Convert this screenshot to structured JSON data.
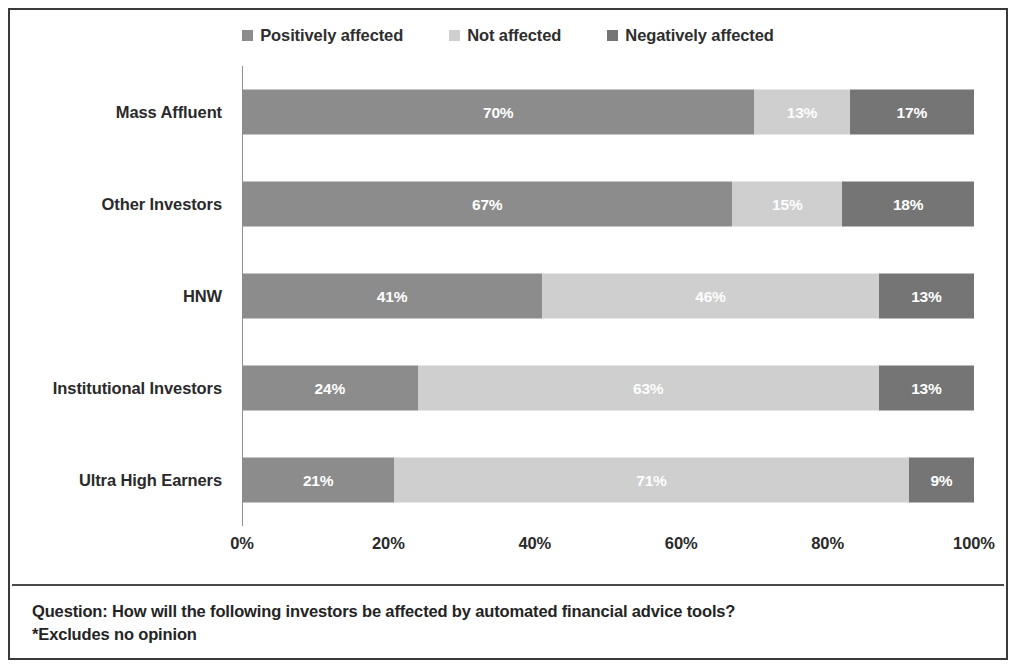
{
  "chart_data": {
    "type": "bar",
    "orientation": "horizontal",
    "stacked": true,
    "stack_mode": "percent",
    "title": "",
    "subtitle": "",
    "xlabel": "",
    "ylabel": "",
    "xlim": [
      0,
      100
    ],
    "grid": false,
    "legend_position": "top-center",
    "categories": [
      "Mass Affluent",
      "Other Investors",
      "HNW",
      "Institutional Investors",
      "Ultra High Earners"
    ],
    "xticks": [
      "0%",
      "20%",
      "40%",
      "60%",
      "80%",
      "100%"
    ],
    "xtick_values": [
      0,
      20,
      40,
      60,
      80,
      100
    ],
    "series": [
      {
        "name": "Positively affected",
        "color": "#8c8c8c",
        "values": [
          70,
          67,
          41,
          24,
          21
        ],
        "labels": [
          "70%",
          "67%",
          "41%",
          "24%",
          "21%"
        ]
      },
      {
        "name": "Not affected",
        "color": "#cfcfcf",
        "values": [
          13,
          15,
          46,
          63,
          71
        ],
        "labels": [
          "13%",
          "15%",
          "46%",
          "63%",
          "71%"
        ]
      },
      {
        "name": "Negatively affected",
        "color": "#757575",
        "values": [
          17,
          18,
          13,
          13,
          9
        ],
        "labels": [
          "17%",
          "18%",
          "13%",
          "13%",
          "9%"
        ]
      }
    ],
    "annotations": [
      "Question: How will the following investors be affected by automated financial advice tools?",
      "*Excludes no opinion"
    ]
  },
  "legend": {
    "items": [
      {
        "label": "Positively affected",
        "color": "#8c8c8c"
      },
      {
        "label": "Not affected",
        "color": "#cfcfcf"
      },
      {
        "label": "Negatively affected",
        "color": "#757575"
      }
    ]
  },
  "footer": {
    "question": "Question: How will the following investors be affected by automated financial advice tools?",
    "note": "*Excludes no opinion"
  }
}
